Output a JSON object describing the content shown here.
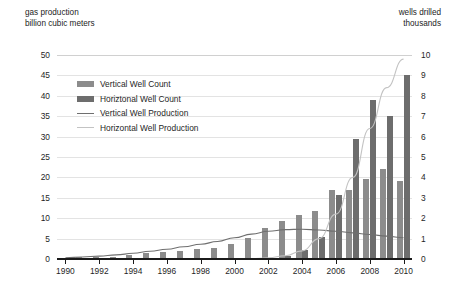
{
  "chart_data": {
    "type": "bar",
    "title": "",
    "subtitle": "",
    "left_axis": {
      "caption_line1": "gas production",
      "caption_line2": "billion cubic meters",
      "ylabel": "billion cubic meters",
      "ylim": [
        0,
        50
      ],
      "ticks": [
        0,
        5,
        10,
        15,
        20,
        25,
        30,
        35,
        40,
        45,
        50
      ],
      "tick_labels": [
        "0",
        "5",
        "10",
        "15",
        "20",
        "25",
        "30",
        "35",
        "40",
        "45",
        "50"
      ]
    },
    "right_axis": {
      "caption_line1": "wells drilled",
      "caption_line2": "thousands",
      "ylabel": "thousands",
      "ylim": [
        0,
        10
      ],
      "ticks": [
        0,
        1,
        2,
        3,
        4,
        5,
        6,
        7,
        8,
        9,
        10
      ],
      "tick_labels": [
        "0",
        "1",
        "2",
        "3",
        "4",
        "5",
        "6",
        "7",
        "8",
        "9",
        "10"
      ]
    },
    "xlabel": "",
    "xlim": [
      1990,
      2010
    ],
    "categories": [
      1990,
      1991,
      1992,
      1993,
      1994,
      1995,
      1996,
      1997,
      1998,
      1999,
      2000,
      2001,
      2002,
      2003,
      2004,
      2005,
      2006,
      2007,
      2008,
      2009,
      2010
    ],
    "x_tick_labels": [
      "1990",
      "1992",
      "1994",
      "1996",
      "1998",
      "2000",
      "2002",
      "2004",
      "2006",
      "2008",
      "2010"
    ],
    "x_ticks": [
      1990,
      1992,
      1994,
      1996,
      1998,
      2000,
      2002,
      2004,
      2006,
      2008,
      2010
    ],
    "grid": true,
    "legend_position": "upper-left-inside",
    "series": [
      {
        "name": "Vertical Well Count",
        "type": "bar",
        "axis": "right",
        "unit": "thousand wells",
        "color": "#8c8c8c",
        "values": [
          0.05,
          0.08,
          0.1,
          0.12,
          0.18,
          0.3,
          0.35,
          0.4,
          0.5,
          0.55,
          0.75,
          1.05,
          1.5,
          1.85,
          2.15,
          2.35,
          3.4,
          3.4,
          3.9,
          4.4,
          3.8
        ]
      },
      {
        "name": "Horizontal Well Count",
        "type": "bar",
        "axis": "right",
        "unit": "thousand wells",
        "color": "#6d6d6d",
        "values": [
          0,
          0,
          0,
          0,
          0,
          0,
          0,
          0,
          0,
          0,
          0,
          0,
          0,
          0.15,
          0.45,
          1.1,
          3.15,
          5.9,
          7.8,
          7.0,
          9.0
        ]
      },
      {
        "name": "Vertical Well Production",
        "type": "line",
        "axis": "left",
        "unit": "billion cubic meters",
        "color": "#6f6f6f",
        "values": [
          0.3,
          0.5,
          0.7,
          1.0,
          1.4,
          1.9,
          2.4,
          3.0,
          3.6,
          4.3,
          5.2,
          6.1,
          6.8,
          7.2,
          7.3,
          7.1,
          6.8,
          6.4,
          6.0,
          5.6,
          5.2
        ]
      },
      {
        "name": "Horizontal Well Production",
        "type": "line",
        "axis": "left",
        "unit": "billion cubic meters",
        "color": "#c3c3c3",
        "values": [
          0,
          0,
          0,
          0,
          0,
          0,
          0,
          0,
          0,
          0,
          0,
          0.1,
          0.3,
          0.8,
          2.0,
          5.0,
          11.0,
          20.0,
          32.0,
          42.0,
          49.0
        ]
      }
    ]
  },
  "legend": {
    "items": [
      {
        "label": "Vertical Well Count",
        "marker": "bar",
        "color": "#8c8c8c"
      },
      {
        "label": "Horiztonal Well Count",
        "marker": "bar",
        "color": "#6d6d6d"
      },
      {
        "label": "Vertical Well Production",
        "marker": "line",
        "color": "#6f6f6f"
      },
      {
        "label": "Horizontal Well Production",
        "marker": "line-light",
        "color": "#c3c3c3"
      }
    ]
  }
}
